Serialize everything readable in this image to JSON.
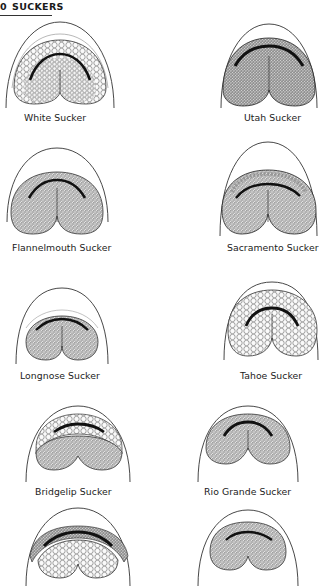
{
  "header": {
    "page_number": "0",
    "section_title": "SUCKERS"
  },
  "figures": [
    {
      "id": "white",
      "label": "White Sucker"
    },
    {
      "id": "utah",
      "label": "Utah Sucker"
    },
    {
      "id": "flannelmouth",
      "label": "Flannelmouth Sucker"
    },
    {
      "id": "sacramento",
      "label": "Sacramento Sucker"
    },
    {
      "id": "longnose",
      "label": "Longnose Sucker"
    },
    {
      "id": "tahoe",
      "label": "Tahoe Sucker"
    },
    {
      "id": "bridgelip",
      "label": "Bridgelip Sucker"
    },
    {
      "id": "riogrande",
      "label": "Rio Grande Sucker"
    },
    {
      "id": "unlabeled-left",
      "label": ""
    },
    {
      "id": "unlabeled-right",
      "label": ""
    }
  ]
}
